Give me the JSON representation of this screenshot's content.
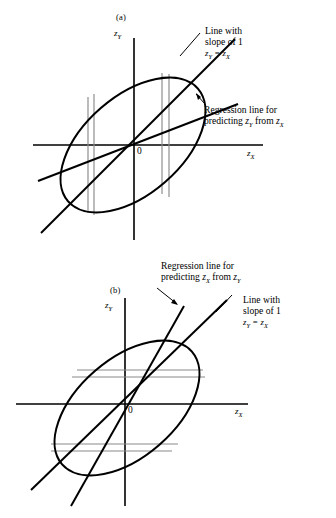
{
  "figure": {
    "title_visible": false,
    "background_color": "#ffffff",
    "line_color": "#000000",
    "thin_line_color": "#8a8a8a",
    "panels": [
      {
        "tag": "(a)",
        "y_axis_label": "z",
        "y_axis_sub": "Y",
        "x_axis_label": "z",
        "x_axis_sub": "X",
        "origin_label": "0",
        "callouts": [
          {
            "name": "slope-one-line-callout",
            "line1": "Line with",
            "line2": "slope of 1",
            "equation_lhs": "z",
            "equation_lhs_sub": "Y",
            "equation_rel": " = ",
            "equation_rhs": "z",
            "equation_rhs_sub": "X"
          },
          {
            "name": "regression-line-callout",
            "line1": "Regression line for",
            "line2_prefix": "predicting ",
            "line2_var1": "z",
            "line2_var1_sub": "Y",
            "line2_mid": " from ",
            "line2_var2": "z",
            "line2_var2_sub": "X"
          }
        ],
        "band_orientation": "vertical",
        "band_count": 4
      },
      {
        "tag": "(b)",
        "y_axis_label": "z",
        "y_axis_sub": "Y",
        "x_axis_label": "z",
        "x_axis_sub": "X",
        "origin_label": "0",
        "callouts": [
          {
            "name": "regression-line-callout",
            "line1": "Regression line for",
            "line2_prefix": "predicting ",
            "line2_var1": "z",
            "line2_var1_sub": "X",
            "line2_mid": " from ",
            "line2_var2": "z",
            "line2_var2_sub": "Y"
          },
          {
            "name": "slope-one-line-callout",
            "line1": "Line with",
            "line2": "slope of 1",
            "equation_lhs": "z",
            "equation_lhs_sub": "Y",
            "equation_rel": " = ",
            "equation_rhs": "z",
            "equation_rhs_sub": "X"
          }
        ],
        "band_orientation": "horizontal",
        "band_count": 4
      }
    ]
  }
}
